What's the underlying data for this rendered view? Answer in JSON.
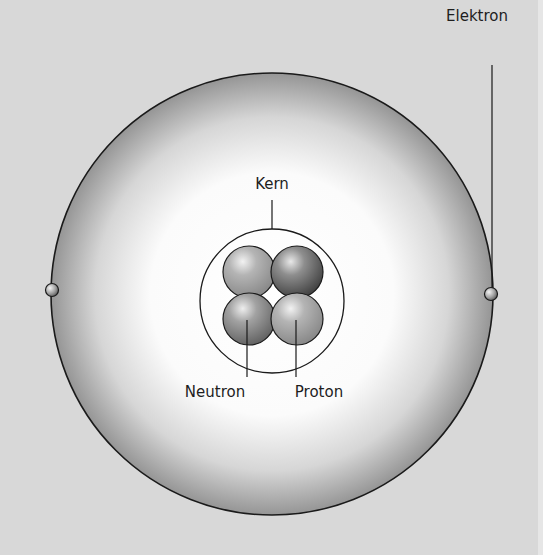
{
  "diagram": {
    "labels": {
      "electron": "Elektron",
      "nucleus": "Kern",
      "neutron": "Neutron",
      "proton": "Proton"
    },
    "colors": {
      "background": "#d8d8d8",
      "orbit_edge": "#8a8a8a",
      "orbit_center": "#ffffff",
      "stroke": "#1a1a1a",
      "nucleon_light": "#a8a8a8",
      "nucleon_dark": "#6e6e6e"
    },
    "components": {
      "electrons": 2,
      "protons": 2,
      "neutrons": 2
    }
  }
}
